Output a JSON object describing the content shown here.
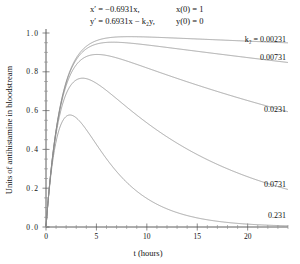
{
  "figure": {
    "equations": {
      "line1_left": "x′ = −0.6931x,",
      "line1_right": "x(0) = 1",
      "line2_left": "y′ = 0.6931x − k₂y,",
      "line2_right": "y(0) = 0"
    }
  },
  "chart_data": {
    "type": "line",
    "title": "",
    "xlabel": "t (hours)",
    "ylabel": "Units of antihistamine in bloodstream",
    "xlim": [
      0,
      24
    ],
    "ylim": [
      0,
      1.0
    ],
    "xticks": [
      0,
      5,
      10,
      15,
      20
    ],
    "xtick_labels": [
      "0",
      "5",
      "10",
      "15",
      "20"
    ],
    "x_minor_step": 1,
    "yticks": [
      0.0,
      0.2,
      0.4,
      0.6,
      0.8,
      1.0
    ],
    "ytick_labels": [
      "0.0",
      "0.2",
      "0.4",
      "0.6",
      "0.8",
      "1.0"
    ],
    "y_minor_step": 0.05,
    "grid": false,
    "legend_position": "inline-right-annotations",
    "model": {
      "k1": 0.6931,
      "x0": 1,
      "y0": 0,
      "solution": "y(t) = 0.6931/(k2-0.6931) * (exp(-0.6931 t) - exp(-k2 t))"
    },
    "series": [
      {
        "name": "k2 = 0.00231",
        "k2": 0.00231,
        "label": "k₂ = 0.00231",
        "label_x": 24,
        "label_y": 0.955,
        "x": [
          0,
          0.5,
          1,
          1.5,
          2,
          2.5,
          3,
          4,
          5,
          6,
          8,
          10,
          12,
          14,
          16,
          18,
          20,
          22,
          24
        ],
        "values": [
          0,
          0.296,
          0.5,
          0.646,
          0.748,
          0.82,
          0.871,
          0.933,
          0.964,
          0.978,
          0.988,
          0.984,
          0.979,
          0.974,
          0.969,
          0.964,
          0.959,
          0.954,
          0.949
        ]
      },
      {
        "name": "k2 = 0.00731",
        "k2": 0.00731,
        "label": "0.00731",
        "label_x": 24,
        "label_y": 0.862,
        "x": [
          0,
          0.5,
          1,
          1.5,
          2,
          2.5,
          3,
          4,
          5,
          6,
          8,
          10,
          12,
          14,
          16,
          18,
          20,
          22,
          24
        ],
        "values": [
          0,
          0.295,
          0.497,
          0.641,
          0.741,
          0.811,
          0.86,
          0.917,
          0.944,
          0.954,
          0.955,
          0.942,
          0.927,
          0.914,
          0.9,
          0.887,
          0.874,
          0.861,
          0.849
        ]
      },
      {
        "name": "k2 = 0.0231",
        "k2": 0.0231,
        "label": "0.0231",
        "label_x": 24,
        "label_y": 0.595,
        "x": [
          0,
          0.5,
          1,
          1.5,
          2,
          2.5,
          3,
          4,
          5,
          6,
          8,
          10,
          12,
          14,
          16,
          18,
          20,
          22,
          24
        ],
        "values": [
          0,
          0.291,
          0.487,
          0.624,
          0.716,
          0.779,
          0.82,
          0.862,
          0.874,
          0.871,
          0.845,
          0.81,
          0.775,
          0.74,
          0.707,
          0.675,
          0.645,
          0.616,
          0.588
        ]
      },
      {
        "name": "k2 = 0.0731",
        "k2": 0.0731,
        "label": "0.0731",
        "label_x": 24,
        "label_y": 0.205,
        "x": [
          0,
          0.5,
          1,
          1.5,
          2,
          2.5,
          3,
          4,
          5,
          6,
          8,
          10,
          12,
          14,
          16,
          18,
          20,
          22,
          24
        ],
        "values": [
          0,
          0.277,
          0.456,
          0.572,
          0.643,
          0.682,
          0.698,
          0.686,
          0.648,
          0.601,
          0.505,
          0.421,
          0.35,
          0.291,
          0.241,
          0.2,
          0.166,
          0.138,
          0.114
        ]
      },
      {
        "name": "k2 = 0.231",
        "k2": 0.231,
        "label": "0.231",
        "label_x": 24,
        "label_y": 0.045,
        "x": [
          0,
          0.5,
          1,
          1.5,
          2,
          2.5,
          3,
          4,
          5,
          6,
          8,
          10,
          12,
          14,
          16,
          18,
          20,
          22,
          24
        ],
        "values": [
          0,
          0.227,
          0.37,
          0.455,
          0.499,
          0.517,
          0.517,
          0.487,
          0.437,
          0.383,
          0.283,
          0.201,
          0.14,
          0.096,
          0.065,
          0.044,
          0.029,
          0.019,
          0.013
        ]
      }
    ]
  }
}
